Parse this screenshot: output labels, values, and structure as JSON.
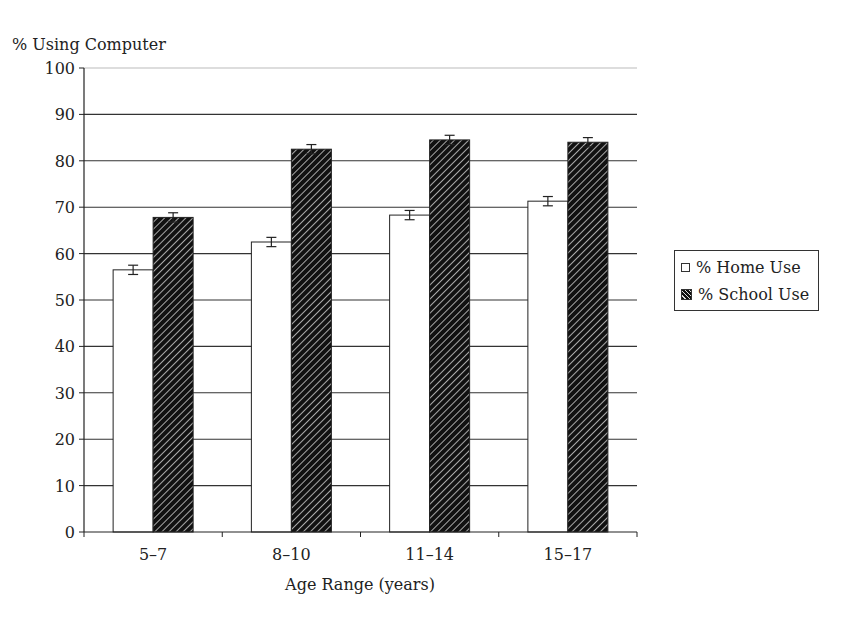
{
  "chart_data": {
    "type": "bar",
    "title": "",
    "ylabel": "% Using Computer",
    "xlabel": "Age Range (years)",
    "categories": [
      "5–7",
      "8–10",
      "11–14",
      "15–17"
    ],
    "series": [
      {
        "name": "% Home Use",
        "values": [
          56.5,
          62.5,
          68.3,
          71.3
        ],
        "fill": "#ffffff",
        "pattern": "none"
      },
      {
        "name": "% School Use",
        "values": [
          67.8,
          82.5,
          84.5,
          84.0
        ],
        "fill": "#111111",
        "pattern": "diagonal-hatch"
      }
    ],
    "error_bars": true,
    "error_bar_halfwidth": 1.0,
    "ylim": [
      0,
      100
    ],
    "yticks": [
      0,
      10,
      20,
      30,
      40,
      50,
      60,
      70,
      80,
      90,
      100
    ],
    "grid": "horizontal",
    "legend_position": "right"
  },
  "labels": {
    "ylabel": "% Using Computer",
    "xlabel": "Age Range (years)",
    "legend_home": "% Home Use",
    "legend_school": "% School Use"
  }
}
